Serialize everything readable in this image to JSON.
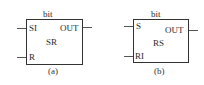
{
  "diagrams": [
    {
      "id": "a",
      "top_label": "bit",
      "name": "SR",
      "inputs": [
        "SI",
        "R"
      ],
      "output": "OUT",
      "caption": "(a)"
    },
    {
      "id": "b",
      "top_label": "bit",
      "name": "RS",
      "inputs": [
        "S",
        "RI"
      ],
      "output": "OUT",
      "caption": "(b)"
    }
  ],
  "colors": {
    "line": "#333333",
    "text": "#2a2a2a",
    "background": "#ffffff"
  }
}
